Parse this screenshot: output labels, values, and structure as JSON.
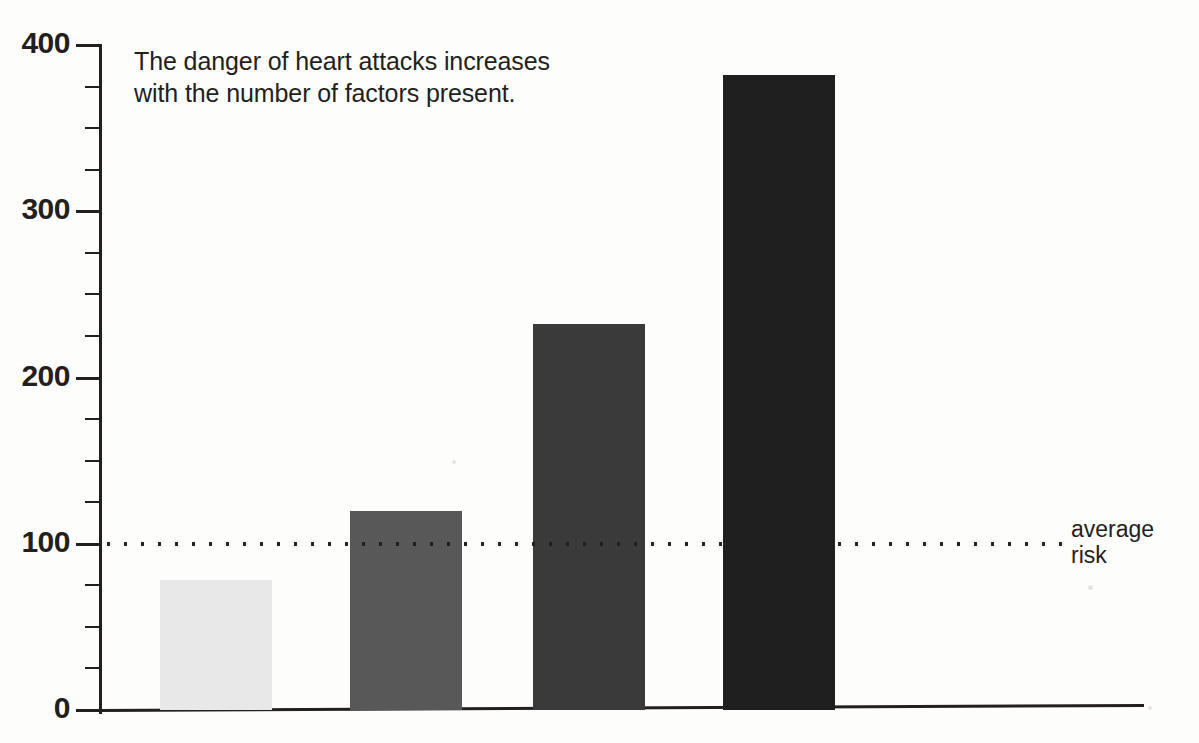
{
  "caption": "The danger of heart attacks increases\nwith the number of factors present.",
  "reference": {
    "label": "average\nrisk",
    "value": 100,
    "style": "dotted"
  },
  "axis": {
    "y_ticks_major": [
      "400",
      "300",
      "200",
      "100",
      "0"
    ],
    "y_major_values": [
      400,
      300,
      200,
      100,
      0
    ],
    "y_minor_step": 25,
    "y_min": 0,
    "y_max": 400
  },
  "legend": {
    "items": [
      {
        "label": "no risk",
        "color": "#e8e8e8"
      },
      {
        "label": "smoking",
        "color": "#585858"
      },
      {
        "label": "smoking and\ncholesterol",
        "color": "#3a3a3a"
      },
      {
        "label": "smoking,\nhigh blood pressure\nand cholesterol",
        "color": "#1f1f1f"
      }
    ]
  },
  "chart_data": {
    "type": "bar",
    "title": "The danger of heart attacks increases with the number of factors present.",
    "xlabel": "",
    "ylabel": "",
    "ylim": [
      0,
      400
    ],
    "yticks": [
      0,
      100,
      200,
      300,
      400
    ],
    "grid": false,
    "legend_position": "right",
    "categories": [
      "no risk",
      "smoking",
      "smoking and cholesterol",
      "smoking, high blood pressure and cholesterol"
    ],
    "values": [
      78,
      120,
      232,
      382
    ],
    "colors": [
      "#e8e8e8",
      "#585858",
      "#3a3a3a",
      "#1f1f1f"
    ],
    "annotations": [
      {
        "type": "hline",
        "value": 100,
        "label": "average risk",
        "style": "dotted"
      }
    ]
  }
}
